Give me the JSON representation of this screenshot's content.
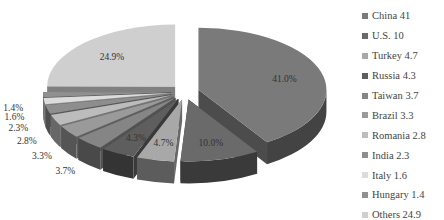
{
  "chart_data": {
    "type": "pie",
    "style": "3d-exploded",
    "title": "",
    "categories": [
      "China",
      "U.S.",
      "Turkey",
      "Russia",
      "Taiwan",
      "Brazil",
      "Romania",
      "India",
      "Italy",
      "Hungary",
      "Others"
    ],
    "values": [
      41.0,
      10.0,
      4.7,
      4.3,
      3.7,
      3.3,
      2.8,
      2.3,
      1.6,
      1.4,
      24.9
    ],
    "data_labels": [
      "41.0%",
      "10.0%",
      "4.7%",
      "4.3%",
      "3.7%",
      "3.3%",
      "2.8%",
      "2.3%",
      "1.6%",
      "1.4%",
      "24.9%"
    ],
    "legend_position": "right",
    "legend": [
      {
        "label": "China 41",
        "color": "#7a7a7a"
      },
      {
        "label": "U.S. 10",
        "color": "#6a6a6a"
      },
      {
        "label": "Turkey 4.7",
        "color": "#a8a8a8"
      },
      {
        "label": "Russia 4.3",
        "color": "#5e5e5e"
      },
      {
        "label": "Taiwan 3.7",
        "color": "#858585"
      },
      {
        "label": "Brazil 3.3",
        "color": "#9a9a9a"
      },
      {
        "label": "Romania 2.8",
        "color": "#bcbcbc"
      },
      {
        "label": "India 2.3",
        "color": "#8e8e8e"
      },
      {
        "label": "Italy 1.6",
        "color": "#dcdcdc"
      },
      {
        "label": "Hungary 1.4",
        "color": "#909090"
      },
      {
        "label": "Others 24.9",
        "color": "#cfcfcf"
      }
    ]
  }
}
